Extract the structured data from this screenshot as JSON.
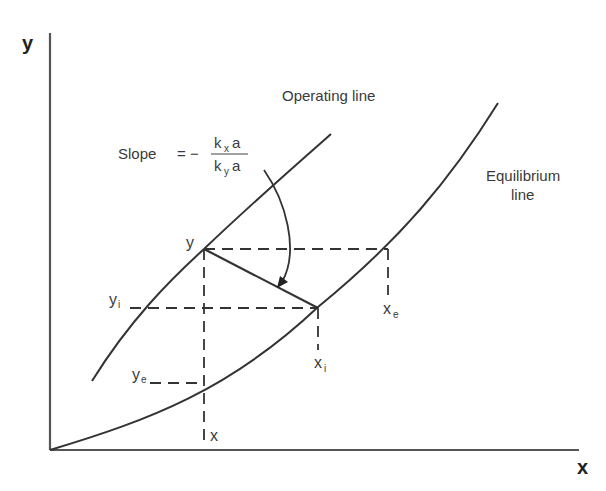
{
  "diagram": {
    "axes": {
      "y_label": "y",
      "x_label": "x"
    },
    "curves": {
      "operating_line_label": "Operating line",
      "equilibrium_line_label_1": "Equilibrium",
      "equilibrium_line_label_2": "line"
    },
    "slope": {
      "prefix": "Slope",
      "equals": "= −",
      "numerator_k": "k",
      "numerator_sub": "x",
      "numerator_a": "a",
      "denominator_k": "k",
      "denominator_sub": "y",
      "denominator_a": "a"
    },
    "points": {
      "y": "y",
      "yi": "y",
      "yi_sub": "i",
      "ye": "y",
      "ye_sub": "e",
      "x": "x",
      "xi": "x",
      "xi_sub": "i",
      "xe": "x",
      "xe_sub": "e"
    }
  }
}
